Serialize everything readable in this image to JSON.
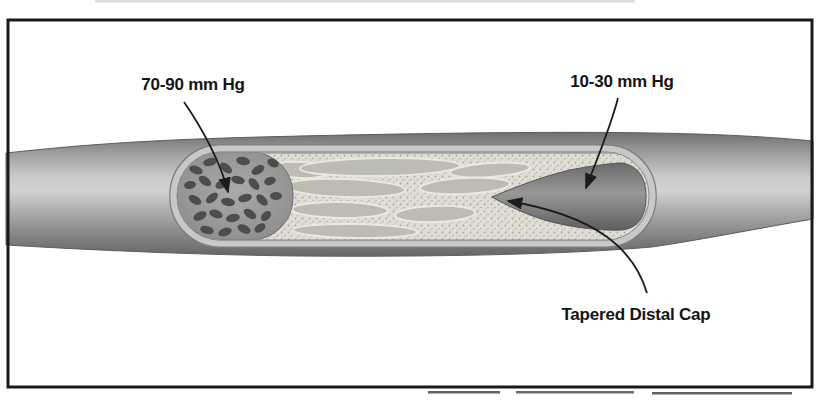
{
  "figure": {
    "kind": "medical-illustration-artery-occlusion",
    "labels": {
      "proximal_pressure": "70-90 mm Hg",
      "distal_pressure": "10-30 mm Hg",
      "distal_cap": "Tapered Distal Cap"
    },
    "palette": {
      "background": "#ffffff",
      "frame": "#1a1a1a",
      "vessel_highlight": "#d2d2d2",
      "vessel_shadow": "#686868",
      "cut_rim": "#c8c8c8",
      "lumen_blood": "#8e8e8e",
      "blood_cell": "#4d4d4d",
      "occlusion_base": "#dfddd5",
      "occlusion_lobe": "#bcbcb2",
      "distal_lumen": "#6f6f6f",
      "label_text": "#141414",
      "arrow": "#1c1c1c"
    }
  }
}
